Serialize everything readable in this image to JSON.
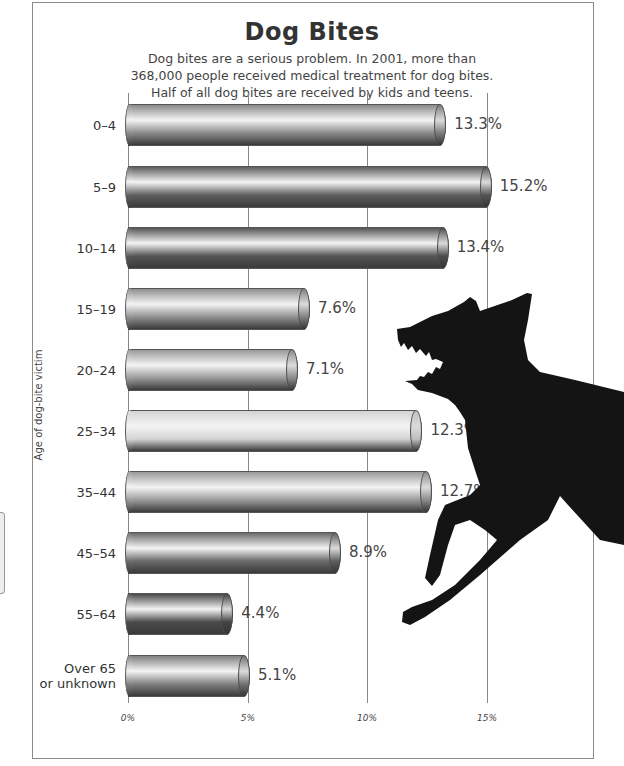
{
  "chart_data": {
    "type": "bar",
    "orientation": "horizontal",
    "title": "Dog Bites",
    "subtitle": [
      "Dog bites are a serious problem. In 2001, more than",
      "368,000 people received medical treatment for dog bites.",
      "Half of all dog bites are received by kids and teens."
    ],
    "ylabel": "Age of dog-bite victim",
    "xlabel": "",
    "categories": [
      "0–4",
      "5–9",
      "10–14",
      "15–19",
      "20–24",
      "25–34",
      "35–44",
      "45–54",
      "55–64",
      "Over 65 or unknown"
    ],
    "values": [
      13.3,
      15.2,
      13.4,
      7.6,
      7.1,
      12.3,
      12.7,
      8.9,
      4.4,
      5.1
    ],
    "value_labels": [
      "13.3%",
      "15.2%",
      "13.4%",
      "7.6%",
      "7.1%",
      "12.3%",
      "12.7%",
      "8.9%",
      "4.4%",
      "5.1%"
    ],
    "xlim": [
      0,
      15
    ],
    "xticks": [
      "0%",
      "5%",
      "10%",
      "15%"
    ],
    "grid": true,
    "legend": "none",
    "bar_shades": [
      "#8a8a8a",
      "#5e5e5e",
      "#555555",
      "#8f8f8f",
      "#999999",
      "#d4d4d4",
      "#9a9a9a",
      "#6a6a6a",
      "#4a4a4a",
      "#808080"
    ]
  },
  "header": {
    "title": "Dog Bites",
    "subtitle_lines": [
      "Dog bites are a serious problem. In 2001, more than",
      "368,000 people received medical treatment for dog bites.",
      "Half of all dog bites are received by kids and teens."
    ]
  },
  "axis": {
    "y_title": "Age of dog-bite victim",
    "x_ticks": [
      {
        "label": "0%",
        "x": 128
      },
      {
        "label": "5%",
        "x": 248
      },
      {
        "label": "10%",
        "x": 367
      },
      {
        "label": "15%",
        "x": 487
      }
    ]
  },
  "rows": [
    {
      "category_lines": [
        "0–4"
      ],
      "value": 13.3,
      "label": "13.3%",
      "shade": "#8a8a8a",
      "y": 104
    },
    {
      "category_lines": [
        "5–9"
      ],
      "value": 15.2,
      "label": "15.2%",
      "shade": "#5e5e5e",
      "y": 166
    },
    {
      "category_lines": [
        "10–14"
      ],
      "value": 13.4,
      "label": "13.4%",
      "shade": "#555555",
      "y": 227
    },
    {
      "category_lines": [
        "15–19"
      ],
      "value": 7.6,
      "label": "7.6%",
      "shade": "#8f8f8f",
      "y": 288
    },
    {
      "category_lines": [
        "20–24"
      ],
      "value": 7.1,
      "label": "7.1%",
      "shade": "#999999",
      "y": 349
    },
    {
      "category_lines": [
        "25–34"
      ],
      "value": 12.3,
      "label": "12.3%",
      "shade": "#d4d4d4",
      "y": 410
    },
    {
      "category_lines": [
        "35–44"
      ],
      "value": 12.7,
      "label": "12.7%",
      "shade": "#9a9a9a",
      "y": 471
    },
    {
      "category_lines": [
        "45–54"
      ],
      "value": 8.9,
      "label": "8.9%",
      "shade": "#6a6a6a",
      "y": 532
    },
    {
      "category_lines": [
        "55–64"
      ],
      "value": 4.4,
      "label": "4.4%",
      "shade": "#4a4a4a",
      "y": 593
    },
    {
      "category_lines": [
        "Over 65",
        "or unknown"
      ],
      "value": 5.1,
      "label": "5.1%",
      "shade": "#808080",
      "y": 655
    }
  ],
  "illustration": {
    "name": "snarling dog silhouette",
    "color": "#111111"
  }
}
